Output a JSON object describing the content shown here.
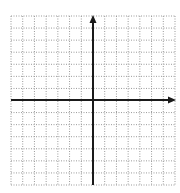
{
  "diagram": {
    "type": "coordinate-plane",
    "grid": {
      "columns": 14,
      "rows": 14,
      "left": 11,
      "top": 16,
      "right": 175,
      "bottom": 185,
      "line_color": "#9a9a9a",
      "line_style": "dotted"
    },
    "axes": {
      "origin_px": {
        "x": 93,
        "y": 100
      },
      "color": "#1a1a1a",
      "width": 2,
      "x_axis": {
        "from": 11,
        "to": 176,
        "arrow": "right"
      },
      "y_axis": {
        "from": 185,
        "to": 15,
        "arrow": "up"
      }
    },
    "quadrant_cells": {
      "left": 7,
      "right": 7,
      "above": 7,
      "below": 7
    }
  }
}
